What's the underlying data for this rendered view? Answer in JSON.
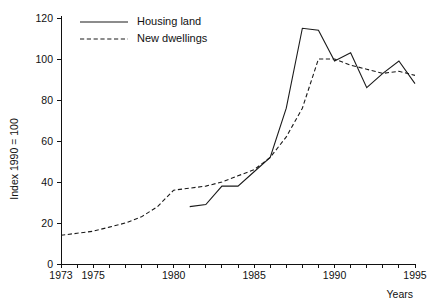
{
  "chart_data": {
    "type": "line",
    "title": "",
    "subtitle": "",
    "xlabel": "Years",
    "ylabel": "Index 1990 = 100",
    "xlim": [
      1973,
      1995
    ],
    "ylim": [
      0,
      120
    ],
    "grid": false,
    "legend_position": "top-left",
    "y_ticks": [
      0,
      20,
      40,
      60,
      80,
      100,
      120
    ],
    "y_tick_labels": [
      "0",
      "20",
      "40",
      "60",
      "80",
      "100",
      "120"
    ],
    "x_ticks": [
      1973,
      1975,
      1980,
      1985,
      1990,
      1995
    ],
    "x_tick_labels": [
      "1973",
      "1975",
      "1980",
      "1985",
      "1990",
      "1995"
    ],
    "x_minor_ticks": [
      1974,
      1976,
      1977,
      1978,
      1979,
      1981,
      1982,
      1983,
      1984,
      1986,
      1987,
      1988,
      1989,
      1991,
      1992,
      1993,
      1994
    ],
    "series": [
      {
        "name": "Housing land",
        "style": "solid",
        "color": "#1a1a1a",
        "x": [
          1981,
          1982,
          1983,
          1984,
          1985,
          1986,
          1987,
          1988,
          1989,
          1990,
          1991,
          1992,
          1993,
          1994,
          1995
        ],
        "values": [
          28,
          29,
          38,
          38,
          45,
          52,
          76,
          115,
          114,
          99,
          103,
          86,
          93,
          99,
          88
        ]
      },
      {
        "name": "New dwellings",
        "style": "dashed",
        "color": "#1a1a1a",
        "x": [
          1973,
          1974,
          1975,
          1976,
          1977,
          1978,
          1979,
          1980,
          1981,
          1982,
          1983,
          1984,
          1985,
          1986,
          1987,
          1988,
          1989,
          1990,
          1991,
          1992,
          1993,
          1994,
          1995
        ],
        "values": [
          14,
          15,
          16,
          18,
          20,
          23,
          28,
          36,
          37,
          38,
          40,
          43,
          46,
          52,
          62,
          76,
          100,
          100,
          97,
          95,
          93,
          94,
          92
        ]
      }
    ]
  },
  "legend": {
    "entries": [
      {
        "label": "Housing land",
        "style": "solid"
      },
      {
        "label": "New dwellings",
        "style": "dashed"
      }
    ]
  }
}
